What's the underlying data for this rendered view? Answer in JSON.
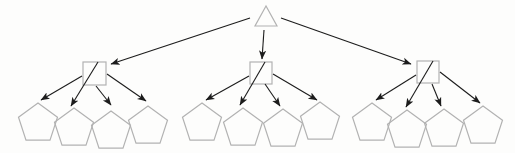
{
  "canvas": {
    "width": 515,
    "height": 153,
    "background": "#fdfdfc"
  },
  "palette": {
    "shape_outline": "#b2b2b2",
    "shape_fill": "none",
    "arrow": "#1c1c1c"
  },
  "stroke": {
    "shape_width": 1.2,
    "arrow_width": 1.1
  },
  "nodes": {
    "root": {
      "id": "root",
      "shape": "triangle",
      "points": [
        [
          266,
          6
        ],
        [
          255,
          26
        ],
        [
          277,
          26
        ]
      ]
    },
    "internal": [
      {
        "id": "internal-1",
        "shape": "square",
        "x": 83,
        "y": 62,
        "size": 23
      },
      {
        "id": "internal-2",
        "shape": "square",
        "x": 250,
        "y": 62,
        "size": 22
      },
      {
        "id": "internal-3",
        "shape": "square",
        "x": 417,
        "y": 61,
        "size": 22
      }
    ],
    "leaves": [
      {
        "id": "leaf-1",
        "shape": "pentagon",
        "cx": 38,
        "top_y": 103,
        "r": 20.5
      },
      {
        "id": "leaf-2",
        "shape": "pentagon",
        "cx": 74,
        "top_y": 108,
        "r": 20.5
      },
      {
        "id": "leaf-3",
        "shape": "pentagon",
        "cx": 111,
        "top_y": 111,
        "r": 20.5
      },
      {
        "id": "leaf-4",
        "shape": "pentagon",
        "cx": 148,
        "top_y": 106,
        "r": 20.5
      },
      {
        "id": "leaf-5",
        "shape": "pentagon",
        "cx": 202,
        "top_y": 103,
        "r": 20.5
      },
      {
        "id": "leaf-6",
        "shape": "pentagon",
        "cx": 243,
        "top_y": 108,
        "r": 20.5
      },
      {
        "id": "leaf-7",
        "shape": "pentagon",
        "cx": 283,
        "top_y": 109,
        "r": 20.5
      },
      {
        "id": "leaf-8",
        "shape": "pentagon",
        "cx": 320,
        "top_y": 102,
        "r": 20.5
      },
      {
        "id": "leaf-9",
        "shape": "pentagon",
        "cx": 372,
        "top_y": 103,
        "r": 20.5
      },
      {
        "id": "leaf-10",
        "shape": "pentagon",
        "cx": 407,
        "top_y": 110,
        "r": 20.5
      },
      {
        "id": "leaf-11",
        "shape": "pentagon",
        "cx": 444,
        "top_y": 109,
        "r": 20.5
      },
      {
        "id": "leaf-12",
        "shape": "pentagon",
        "cx": 483,
        "top_y": 106,
        "r": 20.5
      }
    ]
  },
  "edges": [
    {
      "from": "root",
      "to": "internal-1",
      "x1": 250,
      "y1": 18,
      "x2": 111,
      "y2": 64
    },
    {
      "from": "root",
      "to": "internal-2",
      "x1": 264,
      "y1": 30,
      "x2": 262,
      "y2": 59
    },
    {
      "from": "root",
      "to": "internal-3",
      "x1": 281,
      "y1": 18,
      "x2": 411,
      "y2": 64
    },
    {
      "from": "internal-1",
      "to": "leaf-1",
      "x1": 82,
      "y1": 76,
      "x2": 41,
      "y2": 100
    },
    {
      "from": "internal-1",
      "to": "leaf-2",
      "x1": 98,
      "y1": 62,
      "x2": 71,
      "y2": 106
    },
    {
      "from": "internal-1",
      "to": "leaf-3",
      "x1": 96,
      "y1": 86,
      "x2": 111,
      "y2": 105
    },
    {
      "from": "internal-1",
      "to": "leaf-4",
      "x1": 107,
      "y1": 74,
      "x2": 146,
      "y2": 101
    },
    {
      "from": "internal-2",
      "to": "leaf-5",
      "x1": 249,
      "y1": 76,
      "x2": 206,
      "y2": 100
    },
    {
      "from": "internal-2",
      "to": "leaf-6",
      "x1": 265,
      "y1": 62,
      "x2": 240,
      "y2": 105
    },
    {
      "from": "internal-2",
      "to": "leaf-7",
      "x1": 265,
      "y1": 84,
      "x2": 280,
      "y2": 106
    },
    {
      "from": "internal-2",
      "to": "leaf-8",
      "x1": 273,
      "y1": 74,
      "x2": 317,
      "y2": 100
    },
    {
      "from": "internal-3",
      "to": "leaf-9",
      "x1": 416,
      "y1": 75,
      "x2": 376,
      "y2": 100
    },
    {
      "from": "internal-3",
      "to": "leaf-10",
      "x1": 433,
      "y1": 61,
      "x2": 406,
      "y2": 107
    },
    {
      "from": "internal-3",
      "to": "leaf-11",
      "x1": 432,
      "y1": 84,
      "x2": 441,
      "y2": 106
    },
    {
      "from": "internal-3",
      "to": "leaf-12",
      "x1": 440,
      "y1": 72,
      "x2": 480,
      "y2": 103
    }
  ]
}
